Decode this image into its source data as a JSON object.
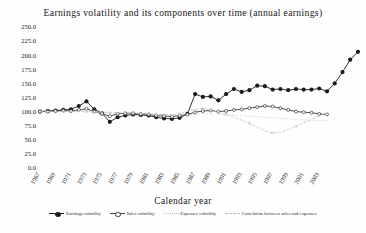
{
  "chart_data": {
    "type": "line",
    "title": "Earnings volatility and its components over time (annual earnings)",
    "xlabel": "Calendar year",
    "ylabel": "",
    "ylim": [
      0,
      250
    ],
    "yticks": [
      "0.0",
      "25.0",
      "50.0",
      "75.0",
      "100.0",
      "125.0",
      "150.0",
      "175.0",
      "200.0",
      "225.0",
      "250.0"
    ],
    "grid": false,
    "legend_position": "bottom",
    "x": [
      1967,
      1968,
      1969,
      1970,
      1971,
      1972,
      1973,
      1974,
      1975,
      1976,
      1977,
      1978,
      1979,
      1980,
      1981,
      1982,
      1983,
      1984,
      1985,
      1986,
      1987,
      1988,
      1989,
      1990,
      1991,
      1992,
      1993,
      1994,
      1995,
      1996,
      1997,
      1998,
      1999,
      2000,
      2001,
      2002,
      2003,
      2004
    ],
    "xtick_labels": [
      "1967",
      "1969",
      "1971",
      "1973",
      "1975",
      "1977",
      "1979",
      "1981",
      "1983",
      "1985",
      "1987",
      "1989",
      "1991",
      "1993",
      "1995",
      "1997",
      "1999",
      "2001",
      "2003"
    ],
    "series": [
      {
        "name": "Earnings volatility",
        "color": "#1c1c1c",
        "style": "solid-marker",
        "values": [
          100,
          101,
          102,
          103,
          104,
          110,
          118,
          104,
          97,
          82,
          90,
          93,
          95,
          94,
          93,
          90,
          88,
          87,
          89,
          96,
          131,
          126,
          127,
          120,
          131,
          140,
          135,
          138,
          146,
          145,
          139,
          140,
          138,
          140,
          139,
          139,
          141,
          136
        ]
      },
      {
        "name": "Sales volatility",
        "color": "#3a3a3a",
        "style": "solid-marker-open",
        "values": [
          100,
          100,
          101,
          102,
          101,
          103,
          105,
          100,
          96,
          92,
          96,
          97,
          97,
          96,
          95,
          93,
          92,
          91,
          93,
          95,
          99,
          101,
          102,
          100,
          101,
          103,
          104,
          106,
          108,
          110,
          109,
          106,
          103,
          100,
          99,
          98,
          96,
          95
        ]
      },
      {
        "name": "Expenses volatility",
        "color": "#b9b9b9",
        "style": "dotted",
        "values": [
          100,
          100,
          100,
          100,
          100,
          100,
          100,
          99,
          98,
          97,
          97,
          97,
          97,
          96,
          96,
          95,
          95,
          94,
          94,
          94,
          95,
          96,
          96,
          96,
          95,
          94,
          93,
          92,
          91,
          90,
          89,
          88,
          87,
          86,
          85,
          85,
          84,
          84
        ]
      },
      {
        "name": "Correlation between sales and expenses",
        "color": "#c2c2c2",
        "style": "dashed-marker",
        "values": [
          100,
          100,
          100,
          100,
          100,
          100,
          100,
          99,
          99,
          98,
          98,
          98,
          97,
          97,
          96,
          95,
          95,
          94,
          96,
          101,
          104,
          106,
          103,
          99,
          95,
          90,
          85,
          79,
          72,
          66,
          62,
          63,
          68,
          74,
          80,
          86,
          93,
          97
        ]
      }
    ],
    "continued": {
      "earnings_tail_x": [
        2005,
        2006,
        2007,
        2008
      ],
      "earnings_tail_values": [
        150,
        170,
        192,
        206
      ]
    }
  },
  "legend": {
    "items": [
      {
        "label": "Earnings volatility"
      },
      {
        "label": "Sales volatility"
      },
      {
        "label": "Expenses volatility"
      },
      {
        "label": "Correlation between sales and expenses"
      }
    ]
  }
}
